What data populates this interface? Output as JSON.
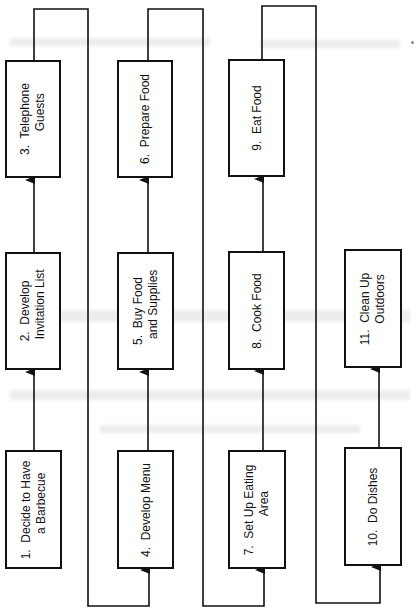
{
  "diagram": {
    "type": "flowchart",
    "orientation": "rotated-90",
    "line_color": "#111111",
    "background": "#ffffff",
    "steps": [
      {
        "id": 1,
        "label": "1.  Decide to Have\n    a Barbecue"
      },
      {
        "id": 2,
        "label": "2.  Develop\n    Invitation List"
      },
      {
        "id": 3,
        "label": "3.  Telephone\n    Guests"
      },
      {
        "id": 4,
        "label": "4.  Develop Menu"
      },
      {
        "id": 5,
        "label": "5.  Buy Food\n    and Supplies"
      },
      {
        "id": 6,
        "label": "6.  Prepare Food"
      },
      {
        "id": 7,
        "label": "7.  Set Up Eating\n    Area"
      },
      {
        "id": 8,
        "label": "8.  Cook Food"
      },
      {
        "id": 9,
        "label": "9.  Eat Food"
      },
      {
        "id": 10,
        "label": "10.  Do Dishes"
      },
      {
        "id": 11,
        "label": "11.  Clean Up\n      Outdoors"
      }
    ],
    "flow": [
      [
        1,
        2
      ],
      [
        2,
        3
      ],
      [
        3,
        4
      ],
      [
        4,
        5
      ],
      [
        5,
        6
      ],
      [
        6,
        7
      ],
      [
        7,
        8
      ],
      [
        8,
        9
      ],
      [
        9,
        10
      ],
      [
        10,
        11
      ]
    ]
  }
}
